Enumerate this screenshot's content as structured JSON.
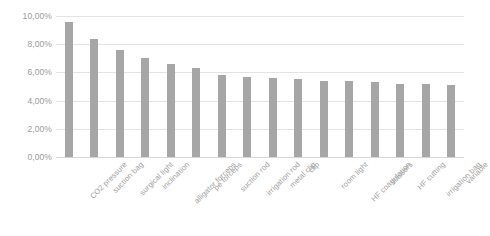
{
  "chart_data": {
    "type": "bar",
    "title": "",
    "subtitle": "",
    "xlabel": "",
    "ylabel": "",
    "ylim": [
      0,
      10
    ],
    "grid": true,
    "legend": false,
    "legend_position": "none",
    "value_suffix": "%",
    "decimal_separator": ",",
    "bar_color": "#a6a6a6",
    "gridline_color": "#e3e3e3",
    "tick_label_color": "#9a9a9a",
    "categories": [
      "CO2 pressure",
      "suction bag",
      "surgical light",
      "inclination",
      "alligator forceps",
      "pe forceps",
      "suction rod",
      "irrigation rod",
      "metal clip",
      "clip",
      "room light",
      "HF coagulation",
      "scissors",
      "HF cutting",
      "irrigation bag",
      "variable"
    ],
    "values": [
      9.6,
      8.4,
      7.6,
      7.0,
      6.6,
      6.3,
      5.8,
      5.7,
      5.6,
      5.5,
      5.4,
      5.4,
      5.3,
      5.2,
      5.2,
      5.1
    ],
    "ytick_labels": [
      "10,00%",
      "8,00%",
      "6,00%",
      "4,00%",
      "2,00%",
      "0,00%"
    ],
    "ytick_values": [
      10,
      8,
      6,
      4,
      2,
      0
    ]
  }
}
